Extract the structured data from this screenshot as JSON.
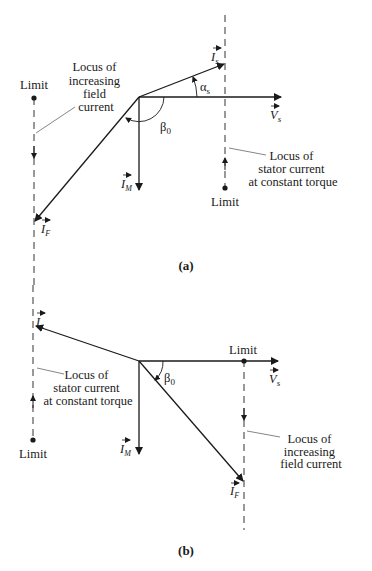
{
  "diagram_a": {
    "caption": "(a)",
    "vectors": {
      "Is": {
        "symbol": "I",
        "sub": "s"
      },
      "Vs": {
        "symbol": "V",
        "sub": "s"
      },
      "IM": {
        "symbol": "I",
        "sub": "M"
      },
      "IF": {
        "symbol": "I",
        "sub": "F"
      }
    },
    "angles": {
      "alpha": "α",
      "alpha_sub": "s",
      "beta": "β",
      "beta_sub": "0"
    },
    "labels": {
      "limit_left": "Limit",
      "limit_right": "Limit",
      "locus_field": [
        "Locus of",
        "increasing",
        "field",
        "current"
      ],
      "locus_stator": [
        "Locus of",
        "stator current",
        "at constant torque"
      ]
    }
  },
  "diagram_b": {
    "caption": "(b)",
    "vectors": {
      "Is": {
        "symbol": "I",
        "sub": "s"
      },
      "Vs": {
        "symbol": "V",
        "sub": "s"
      },
      "IM": {
        "symbol": "I",
        "sub": "M"
      },
      "IF": {
        "symbol": "I",
        "sub": "F"
      }
    },
    "angles": {
      "beta": "β",
      "beta_sub": "0"
    },
    "labels": {
      "limit_left": "Limit",
      "limit_right": "Limit",
      "locus_stator": [
        "Locus of",
        "stator current",
        "at constant torque"
      ],
      "locus_field": [
        "Locus of",
        "increasing",
        "field current"
      ]
    }
  }
}
